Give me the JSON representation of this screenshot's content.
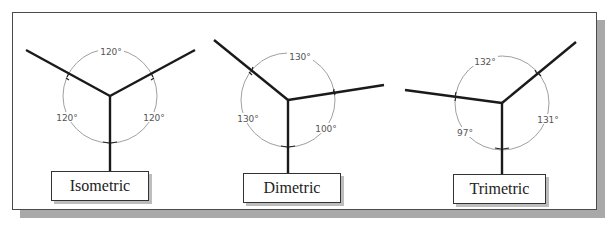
{
  "diagrams": [
    {
      "name": "Isometric",
      "angles": [
        "120°",
        "120°",
        "120°"
      ]
    },
    {
      "name": "Dimetric",
      "angles": [
        "130°",
        "130°",
        "100°"
      ]
    },
    {
      "name": "Trimetric",
      "angles": [
        "132°",
        "97°",
        "131°"
      ]
    }
  ],
  "colors": {
    "axis": "#1a1a1a",
    "arc": "#777777",
    "frame_border": "#4a4a4a",
    "shadow": "#a9a9a9"
  }
}
